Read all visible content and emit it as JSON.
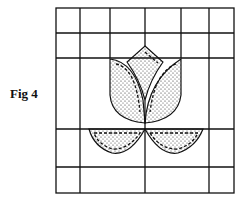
{
  "figure": {
    "label": "Fig 4",
    "colors": {
      "line": "#111111",
      "background": "#ffffff",
      "stipple": "#222222"
    }
  }
}
